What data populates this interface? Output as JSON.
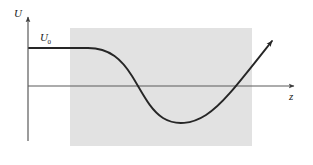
{
  "figure": {
    "caption_present": false,
    "background_color": "#ffffff",
    "axes": {
      "y_axis": {
        "label": "U",
        "label_icon": "y-axis-arrow-icon",
        "color": "#4d4d4d",
        "x_px": 28,
        "top_px": 14,
        "bottom_px": 141
      },
      "x_axis": {
        "label": "z",
        "label_icon": "x-axis-arrow-icon",
        "color": "#4d4d4d",
        "y_px": 86,
        "left_px": 28,
        "right_px": 299
      }
    },
    "shaded_region": {
      "name": "potential-well-region",
      "color": "#e2e2e2",
      "x_px": 70,
      "y_px": 28,
      "width_px": 182,
      "height_px": 118
    },
    "level_annotation": {
      "label": "U",
      "subscript": "0",
      "value_y_px": 48
    },
    "curve": {
      "name": "potential-energy-curve",
      "color": "#262626",
      "stroke_width": 1.9,
      "arrowhead": true,
      "path": "M 29 48 L 88 48 C 110 48 122 60 132 76 C 142 92 150 110 163 118 C 176 126 192 124 206 115 C 222 105 238 84 272 41",
      "arrow_tip_px": [
        272,
        41
      ]
    }
  },
  "chart_data": {
    "type": "line",
    "title": "",
    "xlabel": "z",
    "ylabel": "U",
    "grid": false,
    "legend": null,
    "annotations": [
      {
        "text": "U₀",
        "x_px": 46,
        "y_px": 38,
        "describes": "asymptotic potential level at large negative z"
      }
    ],
    "axis_origin_px": [
      28,
      86
    ],
    "zero_level_label": "0",
    "series": [
      {
        "name": "U(z)",
        "description": "Potential energy starting flat at U0, decreasing through zero into a well, then rising steeply through zero and continuing upward",
        "x": [
          29,
          60,
          88,
          105,
          120,
          132,
          143,
          155,
          165,
          178,
          190,
          200,
          212,
          222,
          234,
          245,
          258,
          272
        ],
        "y_px": [
          48,
          48,
          48,
          53,
          64,
          76,
          86,
          103,
          116,
          121,
          122,
          119,
          112,
          104,
          86,
          72,
          56,
          41
        ],
        "key_points": {
          "plateau_level_U0_px": 48,
          "first_zero_crossing_px": 143,
          "minimum_px": [
            190,
            122
          ],
          "second_zero_crossing_px": 234,
          "endpoint_px": [
            272,
            41
          ]
        }
      }
    ],
    "shaded_region_x_px": [
      70,
      252
    ]
  }
}
